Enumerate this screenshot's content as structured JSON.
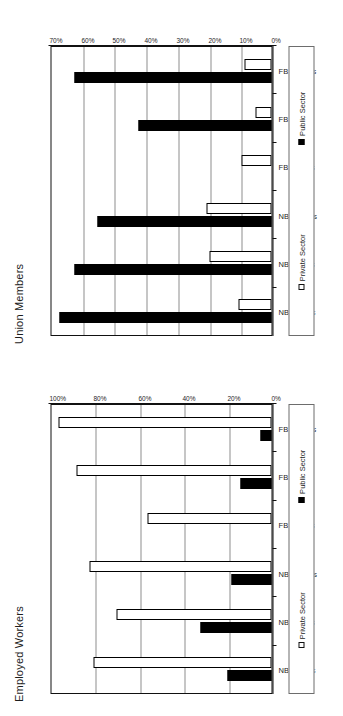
{
  "page": {
    "background": "#ffffff",
    "public_color": "#000000",
    "private_color": "#ffffff",
    "outline_color": "#111111",
    "gridline_color": "#8d8d8d"
  },
  "legend": {
    "private_label": "Private Sector",
    "public_label": "Public Sector",
    "private_swatch_icon": "open-square-icon",
    "public_swatch_icon": "filled-square-icon"
  },
  "chart_data": [
    {
      "id": "union-members",
      "type": "bar",
      "title": "Union Members",
      "xlabel": "",
      "ylabel": "",
      "ylim": [
        0,
        70
      ],
      "grid": true,
      "legend_position": "right",
      "ticklabels": [
        "0%",
        "10%",
        "20%",
        "30%",
        "40%",
        "50%",
        "60%",
        "70%"
      ],
      "tickvalues": [
        0,
        10,
        20,
        30,
        40,
        50,
        60,
        70
      ],
      "categories": [
        "NB Whites",
        "NB Blacks",
        "NB Latinos",
        "FB Whites",
        "FB Asians",
        "FB Latinos"
      ],
      "series": [
        {
          "name": "Private Sector",
          "values": [
            10.5,
            19.5,
            20.5,
            9.5,
            5.0,
            8.5
          ]
        },
        {
          "name": "Public Sector",
          "values": [
            67.0,
            62.0,
            55.0,
            0.0,
            42.0,
            62.0
          ]
        }
      ]
    },
    {
      "id": "employed-workers",
      "type": "bar",
      "title": "Employed Workers",
      "xlabel": "",
      "ylabel": "",
      "ylim": [
        0,
        100
      ],
      "grid": true,
      "legend_position": "right",
      "ticklabels": [
        "0%",
        "20%",
        "40%",
        "60%",
        "80%",
        "100%"
      ],
      "tickvalues": [
        0,
        20,
        40,
        60,
        80,
        100
      ],
      "categories": [
        "NB Whites",
        "NB Blacks",
        "NB Latinos",
        "FB Whites",
        "FB Asians",
        "FB Latinos"
      ],
      "series": [
        {
          "name": "Private Sector",
          "values": [
            80.0,
            70.0,
            82.0,
            56.0,
            88.0,
            96.0
          ]
        },
        {
          "name": "Public Sector",
          "values": [
            20.0,
            32.0,
            18.0,
            0.0,
            14.0,
            5.0
          ]
        }
      ]
    }
  ]
}
